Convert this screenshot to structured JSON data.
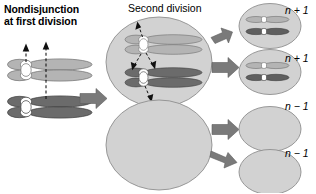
{
  "figure": {
    "title_line1": "Nondisjunction",
    "title_line2": "at first division",
    "second_division_label": "Second division"
  },
  "colors": {
    "cell_fill": "#d2d2d2",
    "cell_stroke": "#8c8c8c",
    "chromatid_light": "#b4b4b4",
    "chromatid_light_stroke": "#6e6e6e",
    "chromatid_dark": "#6b6b6b",
    "chromatid_dark_stroke": "#3c3c3c",
    "centromere": "#ffffff",
    "arrow_gray": "#7a7a7a",
    "dashed_arrow": "#1a1a1a",
    "text": "#000000",
    "background": "#ffffff"
  },
  "left_stage": {
    "name": "meiosis-I-nondisjunction",
    "chromosome_pairs": [
      {
        "id": "light-pair",
        "shade": "light",
        "chromatids": 2,
        "centromere": "white",
        "arrow_count": 2,
        "arrow_direction": "up"
      },
      {
        "id": "dark-pair",
        "shade": "dark",
        "chromatids": 2,
        "centromere": "white",
        "arrow_count": 0,
        "arrow_direction": "none"
      }
    ],
    "transition_arrow": "arrow-right"
  },
  "middle_stage": {
    "name": "second-division",
    "cells": [
      {
        "id": "upper-secondary-cell",
        "contents": "two-chromosome-pairs",
        "chromosome_pairs": [
          {
            "id": "light-pair",
            "shade": "light",
            "chromatids": 2,
            "centromere": "white"
          },
          {
            "id": "dark-pair",
            "shade": "dark",
            "chromatids": 2,
            "centromere": "white"
          }
        ],
        "spindle_arrows": 4
      },
      {
        "id": "lower-secondary-cell",
        "contents": "empty",
        "chromosome_pairs": [],
        "spindle_arrows": 0
      }
    ]
  },
  "right_stage": {
    "name": "gametes",
    "cells": [
      {
        "id": "gamete-1",
        "ploidy_label": "n + 1",
        "chromosomes": [
          {
            "shade": "light",
            "centromere": "white"
          },
          {
            "shade": "dark",
            "centromere": "white"
          }
        ]
      },
      {
        "id": "gamete-2",
        "ploidy_label": "n + 1",
        "chromosomes": [
          {
            "shade": "light",
            "centromere": "white"
          },
          {
            "shade": "dark",
            "centromere": "white"
          }
        ]
      },
      {
        "id": "gamete-3",
        "ploidy_label": "n − 1",
        "chromosomes": []
      },
      {
        "id": "gamete-4",
        "ploidy_label": "n − 1",
        "chromosomes": []
      }
    ]
  },
  "arrows": {
    "stage_transition_count": 5,
    "labels": [
      "left-to-middle",
      "upper-to-gamete-1",
      "upper-to-gamete-2",
      "lower-to-gamete-3",
      "lower-to-gamete-4"
    ]
  }
}
